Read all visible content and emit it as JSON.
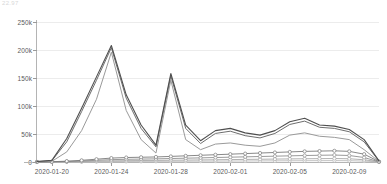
{
  "artifact": {
    "clipped_text": "22.97"
  },
  "chart_data": {
    "type": "line",
    "title": "",
    "subtitle": "",
    "xlabel": "",
    "ylabel": "",
    "grid": true,
    "legend_position": "none",
    "ylim": [
      0,
      250000
    ],
    "ytick_values": [
      0,
      50000,
      100000,
      150000,
      200000,
      250000
    ],
    "ytick_labels": [
      "0",
      "50k",
      "100k",
      "150k",
      "200k",
      "250k"
    ],
    "x": [
      "2020-01-19",
      "2020-01-20",
      "2020-01-21",
      "2020-01-22",
      "2020-01-23",
      "2020-01-24",
      "2020-01-25",
      "2020-01-26",
      "2020-01-27",
      "2020-01-28",
      "2020-01-29",
      "2020-01-30",
      "2020-01-31",
      "2020-02-01",
      "2020-02-02",
      "2020-02-03",
      "2020-02-04",
      "2020-02-05",
      "2020-02-06",
      "2020-02-07",
      "2020-02-08",
      "2020-02-09",
      "2020-02-10",
      "2020-02-11"
    ],
    "xtick_labels": [
      "2020-01-20",
      "2020-01-24",
      "2020-01-28",
      "2020-02-01",
      "2020-02-05",
      "2020-02-09"
    ],
    "xtick_indices": [
      1,
      5,
      9,
      13,
      17,
      21
    ],
    "series": [
      {
        "name": "series-1",
        "color": "#4f4f4f",
        "width": 1.1,
        "markers": false,
        "values": [
          1000,
          3000,
          42000,
          96000,
          152000,
          208000,
          120000,
          66000,
          30000,
          158000,
          66000,
          38000,
          56000,
          60000,
          52000,
          48000,
          56000,
          72000,
          78000,
          66000,
          64000,
          58000,
          40000,
          2000
        ]
      },
      {
        "name": "series-2",
        "color": "#6e6e6e",
        "width": 1.0,
        "markers": false,
        "values": [
          800,
          2400,
          36000,
          90000,
          146000,
          204000,
          114000,
          60000,
          27000,
          154000,
          60000,
          33000,
          51000,
          55000,
          47000,
          43000,
          51000,
          67000,
          73000,
          62000,
          60000,
          54000,
          36000,
          1600
        ]
      },
      {
        "name": "series-3",
        "color": "#9a9a9a",
        "width": 1.0,
        "markers": false,
        "values": [
          400,
          1200,
          18000,
          56000,
          112000,
          196000,
          92000,
          40000,
          16000,
          146000,
          40000,
          22000,
          32000,
          34000,
          30000,
          28000,
          34000,
          48000,
          52000,
          46000,
          44000,
          40000,
          22000,
          900
        ]
      },
      {
        "name": "series-4",
        "color": "#7a7a7a",
        "width": 0.9,
        "markers": true,
        "values": [
          200,
          500,
          1500,
          3000,
          5000,
          7000,
          8000,
          8500,
          9000,
          10000,
          11000,
          12000,
          13000,
          14000,
          15000,
          16000,
          17000,
          18000,
          19000,
          19500,
          20000,
          19000,
          14000,
          600
        ]
      },
      {
        "name": "series-5",
        "color": "#8e8e8e",
        "width": 0.9,
        "markers": true,
        "values": [
          100,
          300,
          900,
          1800,
          3000,
          4200,
          4800,
          5200,
          5600,
          6200,
          6800,
          7400,
          8000,
          8600,
          9200,
          9800,
          10400,
          11000,
          11600,
          12000,
          12400,
          11600,
          8000,
          350
        ]
      },
      {
        "name": "series-6",
        "color": "#a8a8a8",
        "width": 0.9,
        "markers": true,
        "values": [
          60,
          150,
          450,
          900,
          1500,
          2100,
          2400,
          2600,
          2800,
          3100,
          3400,
          3700,
          4000,
          4300,
          4600,
          4900,
          5200,
          5500,
          5800,
          6000,
          6200,
          5800,
          4000,
          180
        ]
      },
      {
        "name": "series-7",
        "color": "#bcbcbc",
        "width": 0.9,
        "markers": true,
        "values": [
          20,
          60,
          180,
          360,
          600,
          840,
          960,
          1040,
          1120,
          1240,
          1360,
          1480,
          1600,
          1720,
          1840,
          1960,
          2080,
          2200,
          2320,
          2400,
          2480,
          2320,
          1600,
          80
        ]
      }
    ],
    "colors": {
      "grid": "#ececec",
      "axis": "#b4b4b4",
      "tick_text": "#5a5a5a",
      "background": "#ffffff"
    }
  }
}
